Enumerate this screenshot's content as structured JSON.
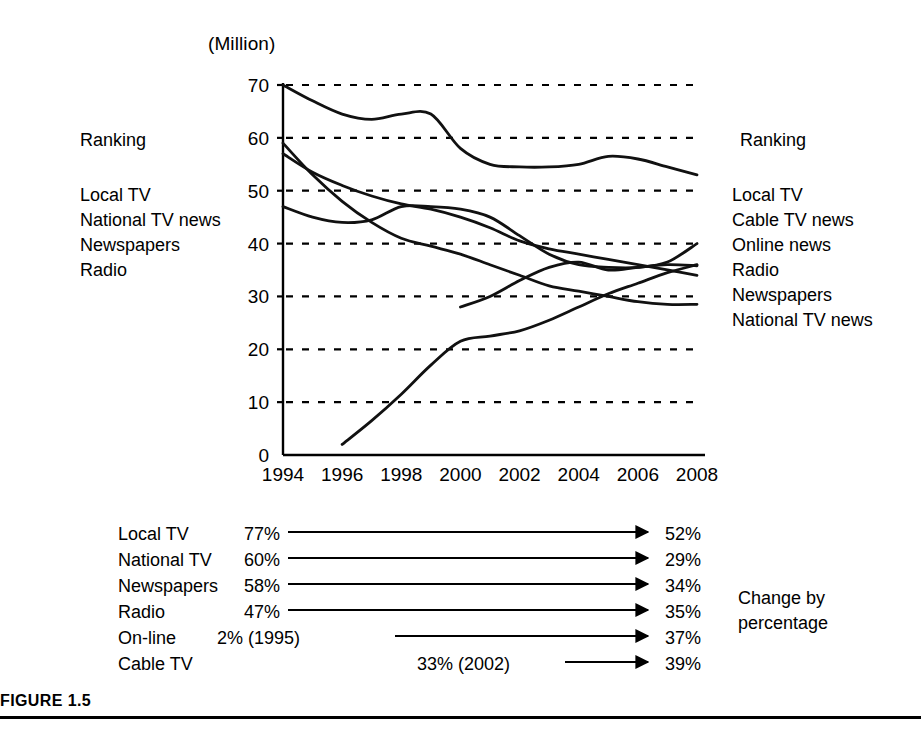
{
  "figure": {
    "caption": "FIGURE 1.5",
    "unit_label": "(Million)"
  },
  "ranking_left": {
    "title": "Ranking",
    "items": [
      "Local TV",
      "National TV news",
      "Newspapers",
      "Radio"
    ]
  },
  "ranking_right": {
    "title": "Ranking",
    "items": [
      "Local TV",
      "Cable TV news",
      "Online news",
      "Radio",
      "Newspapers",
      "National TV news"
    ]
  },
  "change_table": {
    "caption_line1": "Change by",
    "caption_line2": "percentage",
    "rows": [
      {
        "label": "Local TV",
        "start": "77%",
        "end": "52%"
      },
      {
        "label": "National TV",
        "start": "60%",
        "end": "29%"
      },
      {
        "label": "Newspapers",
        "start": "58%",
        "end": "34%"
      },
      {
        "label": "Radio",
        "start": "47%",
        "end": "35%"
      },
      {
        "label": "On-line",
        "start": "2% (1995)",
        "end": "37%"
      },
      {
        "label": "Cable TV",
        "start": "33% (2002)",
        "end": "39%"
      }
    ]
  },
  "chart_data": {
    "type": "line",
    "title": "",
    "xlabel": "",
    "ylabel": "(Million)",
    "xlim": [
      1994,
      2008
    ],
    "ylim": [
      0,
      70
    ],
    "ytick_labels": [
      "0",
      "10",
      "20",
      "30",
      "40",
      "50",
      "60",
      "70"
    ],
    "yticks": [
      0,
      10,
      20,
      30,
      40,
      50,
      60,
      70
    ],
    "xtick_labels": [
      "1994",
      "1996",
      "1998",
      "2000",
      "2002",
      "2004",
      "2006",
      "2008"
    ],
    "xticks": [
      1994,
      1996,
      1998,
      2000,
      2002,
      2004,
      2006,
      2008
    ],
    "grid": "horizontal-dashed",
    "legend": "none",
    "series": [
      {
        "name": "Local TV",
        "x": [
          1994,
          1995,
          1996,
          1997,
          1998,
          1999,
          2000,
          2001,
          2002,
          2003,
          2004,
          2005,
          2006,
          2007,
          2008
        ],
        "values": [
          70,
          67,
          64.5,
          63.5,
          64.5,
          64.5,
          58,
          55,
          54.5,
          54.5,
          55,
          56.5,
          56,
          54.5,
          53
        ]
      },
      {
        "name": "National TV news",
        "x": [
          1994,
          1995,
          1996,
          1997,
          1998,
          1999,
          2000,
          2001,
          2002,
          2003,
          2004,
          2005,
          2006,
          2007,
          2008
        ],
        "values": [
          59,
          53,
          48,
          44,
          41,
          39.5,
          38,
          36,
          34,
          32,
          31,
          30,
          29,
          28.5,
          28.5
        ]
      },
      {
        "name": "Newspapers",
        "x": [
          1994,
          1995,
          1996,
          1997,
          1998,
          1999,
          2000,
          2001,
          2002,
          2003,
          2004,
          2005,
          2006,
          2007,
          2008
        ],
        "values": [
          57,
          53.5,
          51,
          49,
          47.5,
          46.5,
          45,
          43,
          40.5,
          39,
          38,
          37,
          36,
          35,
          34
        ]
      },
      {
        "name": "Radio",
        "x": [
          1994,
          1995,
          1996,
          1997,
          1998,
          1999,
          2000,
          2001,
          2002,
          2003,
          2004,
          2005,
          2006,
          2007,
          2008
        ],
        "values": [
          47,
          45,
          44,
          44.5,
          47,
          47,
          46.5,
          45,
          41.5,
          38,
          36,
          35.5,
          35.5,
          36.5,
          40
        ]
      },
      {
        "name": "Online news",
        "x": [
          1996,
          1997,
          1998,
          1999,
          2000,
          2001,
          2002,
          2003,
          2004,
          2005,
          2006,
          2007,
          2008
        ],
        "values": [
          2,
          6.5,
          11.5,
          17,
          21.5,
          22.5,
          23.5,
          25.5,
          28,
          30.5,
          32.5,
          34.5,
          36
        ]
      },
      {
        "name": "Cable TV news",
        "x": [
          2000,
          2001,
          2002,
          2003,
          2004,
          2005,
          2006,
          2007,
          2008
        ],
        "values": [
          28,
          30,
          33,
          35.5,
          36.5,
          35,
          35.5,
          36,
          35.8
        ]
      }
    ]
  }
}
